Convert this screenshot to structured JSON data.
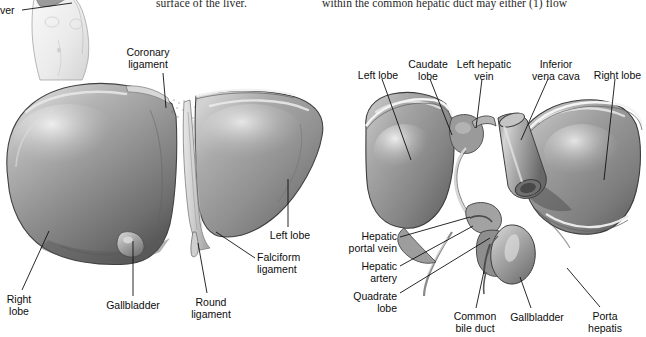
{
  "figure": {
    "background_color": "#ffffff",
    "width": 646,
    "height": 337
  },
  "body_text": {
    "left_column_fragment": "surface of the liver.",
    "right_column_fragment": "within the common hepatic duct may either (1) flow"
  },
  "torso_inset": {
    "label_fragment": "ver",
    "description": "small torso illustration with liver outline, top-left, partially cropped"
  },
  "left_illustration": {
    "name": "anterior-view-of-liver",
    "labels": [
      {
        "id": "coronary-ligament",
        "text": "Coronary\nligament",
        "x": 148,
        "y": 47,
        "align": "center",
        "leader": [
          [
            163,
            73
          ],
          [
            166,
            108
          ]
        ]
      },
      {
        "id": "left-lobe",
        "text": "Left lobe",
        "x": 290,
        "y": 230,
        "align": "center",
        "leader": [
          [
            288,
            227
          ],
          [
            288,
            179
          ]
        ]
      },
      {
        "id": "falciform-ligament",
        "text": "Falciform\nligament",
        "x": 257,
        "y": 252,
        "align": "left",
        "leader": [
          [
            255,
            258
          ],
          [
            216,
            232
          ]
        ]
      },
      {
        "id": "round-ligament",
        "text": "Round\nligament",
        "x": 211,
        "y": 297,
        "align": "center",
        "leader": [
          [
            207,
            293
          ],
          [
            198,
            243
          ]
        ]
      },
      {
        "id": "gallbladder",
        "text": "Gallbladder",
        "x": 133,
        "y": 300,
        "align": "center",
        "leader": [
          [
            133,
            296
          ],
          [
            133,
            241
          ]
        ]
      },
      {
        "id": "right-lobe",
        "text": "Right\nlobe",
        "x": 18,
        "y": 294,
        "align": "center",
        "leader": [
          [
            22,
            290
          ],
          [
            49,
            231
          ]
        ]
      }
    ]
  },
  "right_illustration": {
    "name": "posteroinferior-view-of-liver",
    "labels": [
      {
        "id": "left-lobe",
        "text": "Left lobe",
        "x": 378,
        "y": 70,
        "align": "center",
        "leader": [
          [
            382,
            79
          ],
          [
            411,
            160
          ]
        ]
      },
      {
        "id": "caudate-lobe",
        "text": "Caudate\nlobe",
        "x": 428,
        "y": 59,
        "align": "center",
        "leader": [
          [
            430,
            79
          ],
          [
            452,
            135
          ]
        ]
      },
      {
        "id": "left-hepatic-vein",
        "text": "Left hepatic\nvein",
        "x": 484,
        "y": 59,
        "align": "center",
        "leader": [
          [
            482,
            79
          ],
          [
            476,
            128
          ]
        ]
      },
      {
        "id": "inferior-vena-cava",
        "text": "Inferior\nvena cava",
        "x": 556,
        "y": 59,
        "align": "center",
        "leader": [
          [
            548,
            79
          ],
          [
            521,
            140
          ]
        ]
      },
      {
        "id": "right-lobe",
        "text": "Right lobe",
        "x": 617,
        "y": 70,
        "align": "center",
        "leader": [
          [
            615,
            79
          ],
          [
            604,
            180
          ]
        ]
      },
      {
        "id": "hepatic-portal-vein",
        "text": "Hepatic\nportal vein",
        "x": 397,
        "y": 231,
        "align": "right",
        "leader": [
          [
            400,
            237
          ],
          [
            470,
            217
          ]
        ]
      },
      {
        "id": "hepatic-artery",
        "text": "Hepatic\nartery",
        "x": 397,
        "y": 261,
        "align": "right",
        "leader": [
          [
            400,
            266
          ],
          [
            473,
            226
          ]
        ]
      },
      {
        "id": "quadrate-lobe",
        "text": "Quadrate\nlobe",
        "x": 397,
        "y": 291,
        "align": "right",
        "leader": [
          [
            400,
            293
          ],
          [
            490,
            238
          ]
        ]
      },
      {
        "id": "common-bile-duct",
        "text": "Common\nbile duct",
        "x": 475,
        "y": 311,
        "align": "center",
        "leader": [
          [
            476,
            308
          ],
          [
            484,
            271
          ]
        ]
      },
      {
        "id": "gallbladder",
        "text": "Gallbladder",
        "x": 537,
        "y": 312,
        "align": "center",
        "leader": [
          [
            531,
            308
          ],
          [
            520,
            277
          ]
        ]
      },
      {
        "id": "porta-hepatis",
        "text": "Porta\nhepatis",
        "x": 605,
        "y": 311,
        "align": "center",
        "leader": [
          [
            600,
            307
          ],
          [
            567,
            268
          ]
        ]
      }
    ]
  },
  "colors": {
    "liver_mid": "#8e8e8e",
    "liver_light": "#c3c3c3",
    "liver_dark": "#5f5f5f",
    "liver_highlight": "#e2e2e2",
    "outline": "#3b3b3b",
    "leader_line": "#111111",
    "text": "#0d0d0d",
    "background": "#ffffff"
  }
}
